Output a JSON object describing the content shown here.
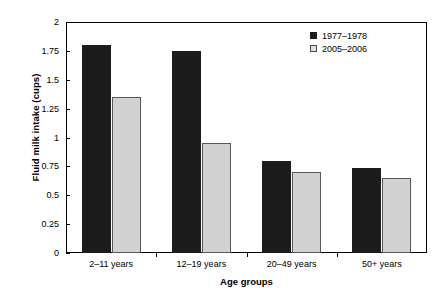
{
  "chart_data": {
    "type": "bar",
    "title": "",
    "subtitle": "",
    "xlabel": "Age groups",
    "ylabel": "Fluid milk intake (cups)",
    "categories": [
      "2–11 years",
      "12–19 years",
      "20–49 years",
      "50+ years"
    ],
    "series": [
      {
        "name": "1977–1978",
        "color": "#1c1c1c",
        "values": [
          1.8,
          1.75,
          0.8,
          0.74
        ]
      },
      {
        "name": "2005–2006",
        "color": "#d2d2d2",
        "values": [
          1.35,
          0.95,
          0.7,
          0.65
        ]
      }
    ],
    "ylim": [
      0,
      2
    ],
    "yticks": [
      0,
      0.25,
      0.5,
      0.75,
      1,
      1.25,
      1.5,
      1.75,
      2
    ],
    "ytick_labels": [
      "0",
      "0.25",
      "0.5",
      "0.75",
      "1",
      "1.25",
      "1.5",
      "1.75",
      "2"
    ],
    "grid": false,
    "legend_position": "top-right",
    "frame": true
  },
  "legend": {
    "items": [
      {
        "label": "1977–1978",
        "swatch": "dark-square-icon"
      },
      {
        "label": "2005–2006",
        "swatch": "light-square-icon"
      }
    ]
  },
  "axes": {
    "x_title": "Age groups",
    "y_title": "Fluid milk intake (cups)"
  }
}
